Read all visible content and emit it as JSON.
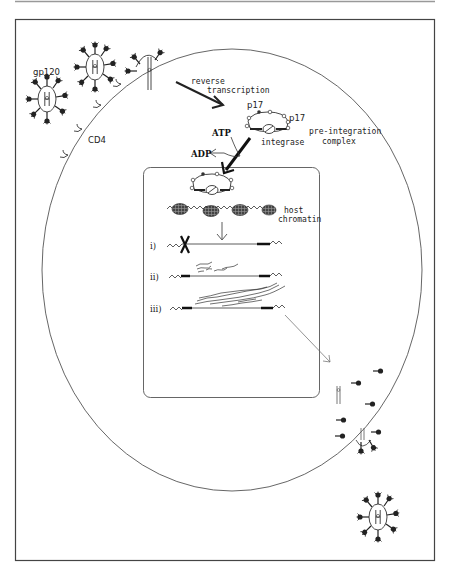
{
  "figure": {
    "labels": {
      "gp120": "gp120",
      "cd4": "CD4",
      "reverse": "reverse",
      "transcription": "transcription",
      "p17_top": "p17",
      "p17_right": "p17",
      "integrase": "integrase",
      "preintegration_1": "pre-integration",
      "preintegration_2": "complex",
      "atp": "ATP",
      "adp": "ADP",
      "host_1": "host",
      "host_2": "chromatin",
      "step_i": "i)",
      "step_ii": "ii)",
      "step_iii": "iii)"
    },
    "colors": {
      "line": "#333333",
      "frame": "#444444",
      "fill_dark": "#333333",
      "top_rule": "#999999"
    }
  }
}
